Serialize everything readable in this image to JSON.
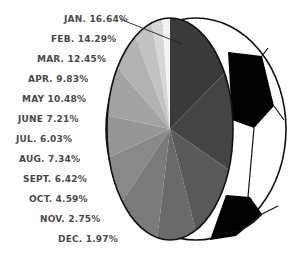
{
  "chart_data": {
    "type": "pie",
    "title": "",
    "categories": [
      "JAN.",
      "FEB.",
      "MAR.",
      "APR.",
      "MAY",
      "JUNE",
      "JUL.",
      "AUG.",
      "SEPT.",
      "OCT.",
      "NOV.",
      "DEC."
    ],
    "values": [
      16.64,
      14.29,
      12.45,
      9.83,
      10.48,
      7.21,
      6.03,
      7.34,
      6.42,
      4.59,
      2.75,
      1.97
    ],
    "unit": "%",
    "labels": [
      "JAN. 16.64%",
      "FEB. 14.29%",
      "MAR. 12.45%",
      "APR. 9.83%",
      "MAY 10.48%",
      "JUNE 7.21%",
      "JUL. 6.03%",
      "AUG. 7.34%",
      "SEPT. 6.42%",
      "OCT. 4.59%",
      "NOV. 2.75%",
      "DEC. 1.97%"
    ],
    "style": "pie drawn on the face of a soccer ball, grayscale slices",
    "legend": "labels listed at left, top to bottom"
  },
  "labels": {
    "jan": "JAN. 16.64%",
    "feb": "FEB. 14.29%",
    "mar": "MAR. 12.45%",
    "apr": "APR. 9.83%",
    "may": "MAY 10.48%",
    "jun": "JUNE 7.21%",
    "jul": "JUL. 6.03%",
    "aug": "AUG. 7.34%",
    "sep": "SEPT. 6.42%",
    "oct": "OCT. 4.59%",
    "nov": "NOV. 2.75%",
    "dec": "DEC. 1.97%"
  }
}
